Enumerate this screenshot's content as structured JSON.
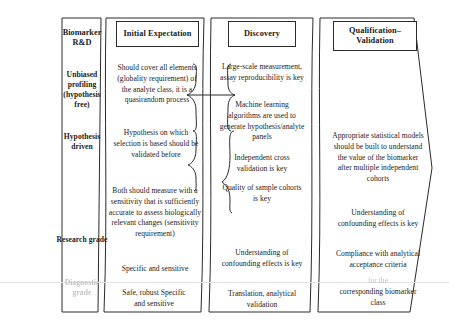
{
  "figure": {
    "columns": [
      {
        "id": "stage-biomarker-rnd",
        "header": "Biomarker R&D",
        "header_style": "plain",
        "rows": [
          {
            "id": "row-unbiased-profiling",
            "label": "Unbiased profiling\n(hypothesis free)",
            "faded": false
          },
          {
            "id": "row-hypothesis-driven",
            "label": "Hypothesis driven",
            "faded": false
          },
          {
            "id": "row-research-grade",
            "label": "Research grade",
            "faded": false
          },
          {
            "id": "row-diagnostic-grade",
            "label": "Diagnostic grade",
            "faded": true
          }
        ]
      },
      {
        "id": "stage-initial-expectation",
        "header": "Initial Expectation",
        "header_style": "boxed",
        "blocks": [
          {
            "id": "ie-globality",
            "text": "Should cover all elements (globality requirement) of the analyte class, it is a quasirandom process",
            "faded": false
          },
          {
            "id": "ie-hypothesis-validation",
            "text": "Hypothesis on which selection is based should be validated before",
            "faded": false
          },
          {
            "id": "ie-sensitivity",
            "text": "Both should measure with a sensitivity that is sufficiently accurate to assess biologically relevant changes (sensitivity requirement)",
            "faded": false
          },
          {
            "id": "ie-specific-sensitive",
            "text": "Specific and sensitive",
            "faded": false
          },
          {
            "id": "ie-safe-robust",
            "text": "Safe, robust Specific and sensitive",
            "faded": false
          }
        ]
      },
      {
        "id": "stage-discovery",
        "header": "Discovery",
        "header_style": "boxed",
        "blocks": [
          {
            "id": "dc-large-scale",
            "text": "Large-scale measurement, assay reproducibility is key",
            "faded": false
          },
          {
            "id": "dc-machine-learning",
            "text": "Machine learning algorithms are used to generate hypothesis/analyte panels",
            "faded": false
          },
          {
            "id": "dc-cross-validation",
            "text": "Independent cross validation is key",
            "faded": false
          },
          {
            "id": "dc-sample-cohorts",
            "text": "Quality of sample cohorts is key",
            "faded": false
          },
          {
            "id": "dc-confounding",
            "text": "Understanding of confounding effects is key",
            "faded": false
          },
          {
            "id": "dc-translation",
            "text": "Translation, analytical validation",
            "faded": false
          }
        ]
      },
      {
        "id": "stage-qualification-validation",
        "header": "Qualification–\nValidation",
        "header_style": "boxed",
        "blocks": [
          {
            "id": "qv-statistical-models",
            "text": "Appropriate statistical models should be built to understand the value of the biomarker after multiple independent cohorts",
            "faded": false
          },
          {
            "id": "qv-confounding",
            "text": "Understanding of confounding effects is key",
            "faded": false
          },
          {
            "id": "qv-compliance",
            "text": "Compliance with analytical acceptance criteria",
            "faded": false
          },
          {
            "id": "qv-for-the",
            "text": "for the",
            "faded": true
          },
          {
            "id": "qv-biomarker-class",
            "text": "corresponding biomarker class",
            "faded": false
          }
        ]
      }
    ],
    "colors": {
      "stroke": "#2a2a2a",
      "text": "#1b1b1b",
      "faded_text": "#c2c2c2",
      "divider": "#e2e2e2",
      "background": "#ffffff"
    }
  }
}
